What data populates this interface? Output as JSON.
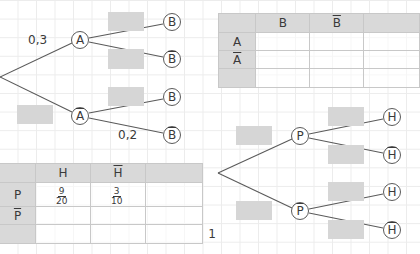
{
  "tree1": {
    "level1": [
      {
        "label": "A",
        "bar": false,
        "probability": "0,3"
      },
      {
        "label": "A",
        "bar": true,
        "probability": ""
      }
    ],
    "level2": [
      {
        "parent": "A",
        "label": "B",
        "bar": false,
        "probability": ""
      },
      {
        "parent": "A",
        "label": "B",
        "bar": true,
        "probability": ""
      },
      {
        "parent": "A-bar",
        "label": "B",
        "bar": false,
        "probability": ""
      },
      {
        "parent": "A-bar",
        "label": "B",
        "bar": true,
        "probability": "0,2"
      }
    ]
  },
  "table1": {
    "col_headers": [
      "",
      "B",
      "B",
      ""
    ],
    "col_bars": [
      false,
      false,
      true,
      false
    ],
    "row_labels": [
      "A",
      "A",
      ""
    ],
    "row_bars": [
      false,
      true,
      false
    ],
    "cells": [
      [
        "",
        "",
        ""
      ],
      [
        "",
        "",
        ""
      ],
      [
        "",
        "",
        "1"
      ]
    ]
  },
  "table2": {
    "col_headers": [
      "",
      "H",
      "H",
      ""
    ],
    "col_bars": [
      false,
      false,
      true,
      false
    ],
    "row_labels": [
      "P",
      "P",
      ""
    ],
    "row_bars": [
      false,
      true,
      false
    ],
    "cells": [
      [
        {
          "num": "9",
          "den": "20"
        },
        {
          "num": "3",
          "den": "10"
        },
        ""
      ],
      [
        "",
        "",
        ""
      ],
      [
        "",
        "",
        "1"
      ]
    ]
  },
  "tree2": {
    "level1": [
      {
        "label": "P",
        "bar": false,
        "probability": ""
      },
      {
        "label": "P",
        "bar": true,
        "probability": ""
      }
    ],
    "level2": [
      {
        "parent": "P",
        "label": "H",
        "bar": false,
        "probability": ""
      },
      {
        "parent": "P",
        "label": "H",
        "bar": true,
        "probability": ""
      },
      {
        "parent": "P-bar",
        "label": "H",
        "bar": false,
        "probability": ""
      },
      {
        "parent": "P-bar",
        "label": "H",
        "bar": true,
        "probability": ""
      }
    ]
  },
  "colors": {
    "blank_box": "#d6d6d6",
    "header_fill": "#d9d9d9",
    "line": "#5a5a5a",
    "text": "#3a3a3a"
  }
}
